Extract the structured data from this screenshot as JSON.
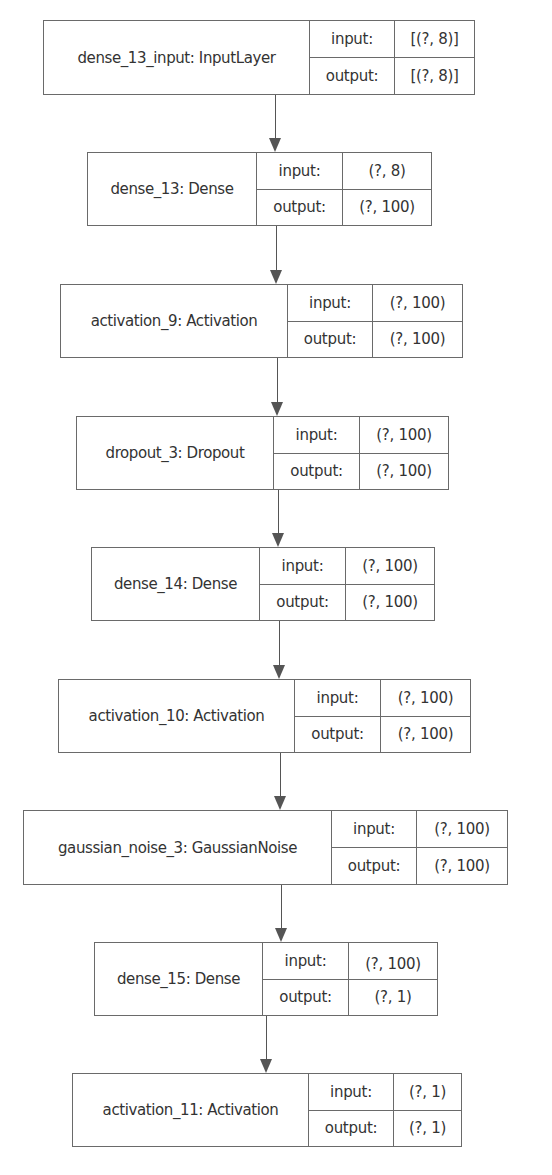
{
  "diagram": {
    "type": "keras-model-plot",
    "labels": {
      "input": "input:",
      "output": "output:"
    },
    "nodes": [
      {
        "name": "dense_13_input: InputLayer",
        "input": "[(?, 8)]",
        "output": "[(?, 8)]"
      },
      {
        "name": "dense_13: Dense",
        "input": "(?, 8)",
        "output": "(?, 100)"
      },
      {
        "name": "activation_9: Activation",
        "input": "(?, 100)",
        "output": "(?, 100)"
      },
      {
        "name": "dropout_3: Dropout",
        "input": "(?, 100)",
        "output": "(?, 100)"
      },
      {
        "name": "dense_14: Dense",
        "input": "(?, 100)",
        "output": "(?, 100)"
      },
      {
        "name": "activation_10: Activation",
        "input": "(?, 100)",
        "output": "(?, 100)"
      },
      {
        "name": "gaussian_noise_3: GaussianNoise",
        "input": "(?, 100)",
        "output": "(?, 100)"
      },
      {
        "name": "dense_15: Dense",
        "input": "(?, 100)",
        "output": "(?, 1)"
      },
      {
        "name": "activation_11: Activation",
        "input": "(?, 1)",
        "output": "(?, 1)"
      }
    ],
    "edges": [
      [
        "dense_13_input",
        "dense_13"
      ],
      [
        "dense_13",
        "activation_9"
      ],
      [
        "activation_9",
        "dropout_3"
      ],
      [
        "dropout_3",
        "dense_14"
      ],
      [
        "dense_14",
        "activation_10"
      ],
      [
        "activation_10",
        "gaussian_noise_3"
      ],
      [
        "gaussian_noise_3",
        "dense_15"
      ],
      [
        "dense_15",
        "activation_11"
      ]
    ]
  }
}
